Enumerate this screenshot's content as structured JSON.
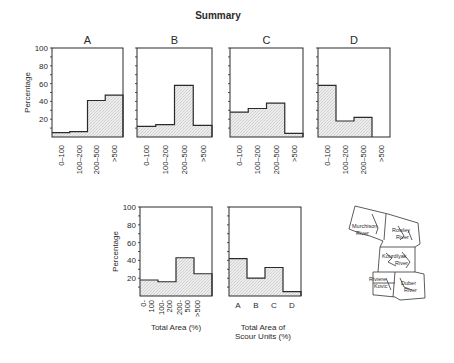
{
  "title": "Summary",
  "chart_data": [
    {
      "type": "bar",
      "panel": "A",
      "title": "A",
      "categories": [
        "0-100",
        "100-200",
        "200-500",
        ">500"
      ],
      "values": [
        5,
        6,
        41,
        47
      ],
      "ylabel": "Percentage",
      "xlabel": "",
      "ylim": [
        0,
        100
      ],
      "yticks": [
        20,
        40,
        60,
        80,
        100
      ]
    },
    {
      "type": "bar",
      "panel": "B",
      "title": "B",
      "categories": [
        "0-100",
        "100-200",
        "200-500",
        ">500"
      ],
      "values": [
        12,
        14,
        58,
        13
      ],
      "ylabel": "",
      "xlabel": "",
      "ylim": [
        0,
        100
      ]
    },
    {
      "type": "bar",
      "panel": "C",
      "title": "C",
      "categories": [
        "0-100",
        "100-200",
        "200-500",
        ">500"
      ],
      "values": [
        28,
        32,
        38,
        4
      ],
      "ylabel": "",
      "xlabel": "",
      "ylim": [
        0,
        100
      ]
    },
    {
      "type": "bar",
      "panel": "D",
      "title": "D",
      "categories": [
        "0-100",
        "100-200",
        "200-500",
        ">500"
      ],
      "values": [
        58,
        18,
        22,
        0
      ],
      "ylabel": "",
      "xlabel": "",
      "ylim": [
        0,
        100
      ]
    },
    {
      "type": "bar",
      "panel": "total-area",
      "title": "",
      "categories": [
        "0-100",
        "100-200",
        "200-500",
        ">500"
      ],
      "values": [
        18,
        16,
        43,
        25
      ],
      "ylabel": "Percentage",
      "xlabel": "Total Area (%)",
      "ylim": [
        0,
        100
      ],
      "yticks": [
        20,
        40,
        60,
        80,
        100
      ]
    },
    {
      "type": "bar",
      "panel": "scour-units",
      "title": "",
      "categories": [
        "A",
        "B",
        "C",
        "D"
      ],
      "values": [
        42,
        20,
        32,
        5
      ],
      "ylabel": "",
      "xlabel": "Total Area of Scour Units (%)",
      "ylim": [
        0,
        100
      ]
    }
  ],
  "map": {
    "labels": [
      "Murchison River",
      "Rowley River",
      "Kourdlyak River",
      "Riviere Kovic",
      "Duber River"
    ],
    "lines": {
      "murchison": [
        "Murchison",
        "River"
      ],
      "rowley": [
        "Rowley",
        "River"
      ],
      "kourd": [
        "Kourdlyak",
        "River"
      ],
      "kovic": [
        "Riviere",
        "Kovic"
      ],
      "duber": [
        "Duber",
        "River"
      ]
    }
  },
  "labels": {
    "percentage": "Percentage",
    "total_area": "Total Area (%)",
    "scour_line1": "Total Area of",
    "scour_line2": "Scour Units (%)",
    "yticks": [
      "100",
      "80",
      "60",
      "40",
      "20"
    ],
    "bottom_left_cats": [
      [
        "0-",
        "100"
      ],
      [
        "100-",
        "200"
      ],
      [
        "200-",
        "500"
      ],
      [
        ">500"
      ]
    ]
  },
  "colors": {
    "line": "#2a2a2a",
    "fill": "#e4e4e4"
  }
}
